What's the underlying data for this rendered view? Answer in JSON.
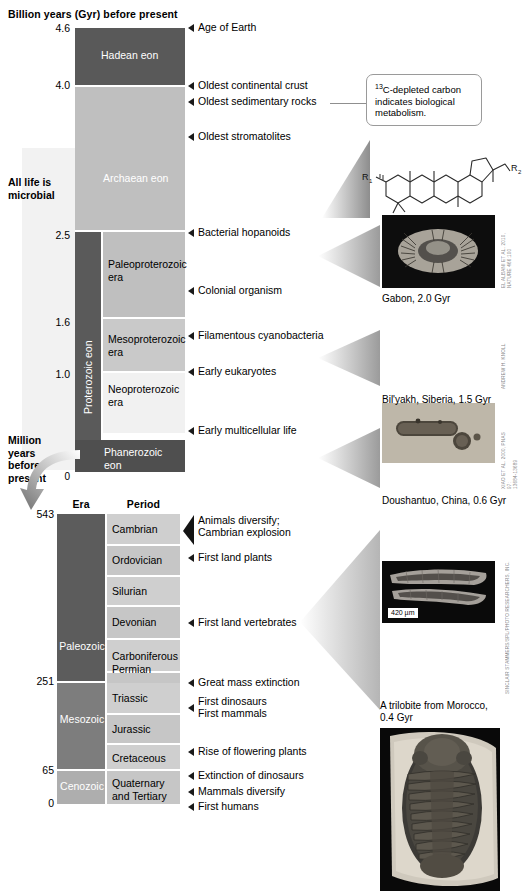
{
  "headers": {
    "top_axis_title": "Billion years (Gyr) before present",
    "lower_axis_title_line1": "Million",
    "lower_axis_title_line2": "years",
    "lower_axis_title_line3": "before",
    "lower_axis_title_line4": "present",
    "era_col": "Era",
    "period_col": "Period"
  },
  "side_note": {
    "line1": "All life is",
    "line2": "microbial"
  },
  "axis_gyr": [
    "4.6",
    "4.0",
    "2.5",
    "1.6",
    "1.0",
    "0"
  ],
  "axis_myr": [
    "543",
    "251",
    "65",
    "0"
  ],
  "eons": {
    "hadean": "Hadean eon",
    "archaean": "Archaean eon",
    "proterozoic": "Proterozoic eon",
    "phanerozoic_l1": "Phanerozoic",
    "phanerozoic_l2": "eon"
  },
  "proterozoic_eras": [
    {
      "l1": "Paleoproterozoic",
      "l2": "era"
    },
    {
      "l1": "Mesoproterozoic",
      "l2": "era"
    },
    {
      "l1": "Neoproterozoic",
      "l2": "era"
    }
  ],
  "phanerozoic_eras": [
    "Paleozoic",
    "Mesozoic",
    "Cenozoic"
  ],
  "periods": [
    "Cambrian",
    "Ordovician",
    "Silurian",
    "Devonian",
    "Carboniferous",
    "Permian",
    "Triassic",
    "Jurassic",
    "Cretaceous",
    "Quaternary and Tertiary"
  ],
  "period_cenozoic_l1": "Quaternary",
  "period_cenozoic_l2": "and Tertiary",
  "events_upper": [
    "Age of Earth",
    "Oldest continental crust",
    "Oldest sedimentary rocks",
    "Oldest stromatolites",
    "Bacterial hopanoids",
    "Colonial organism",
    "Filamentous cyanobacteria",
    "Early eukaryotes",
    "Early multicellular life"
  ],
  "events_lower": [
    "Animals diversify;",
    "Cambrian explosion",
    "First land plants",
    "First land vertebrates",
    "Great mass extinction",
    "First dinosaurs",
    "First mammals",
    "Rise of flowering plants",
    "Extinction of dinosaurs",
    "Mammals diversify",
    "First humans"
  ],
  "callout": {
    "sup": "13",
    "text_rest": "C-depleted carbon indicates biological metabolism."
  },
  "molecule": {
    "r1": "R",
    "r1_sub": "1",
    "r2": "R",
    "r2_sub": "2"
  },
  "photos": [
    {
      "caption": "Gabon, 2.0 Gyr",
      "credit": "EL ALBANI ET AL. 2010,\nNATURE 466:100",
      "scalebar": ""
    },
    {
      "caption": "Bil'yakh, Siberia, 1.5 Gyr",
      "credit": "ANDREW H. KNOLL",
      "scalebar": ""
    },
    {
      "caption": "Doushantuo, China, 0.6 Gyr",
      "credit": "XIAO ET AL. 2000, PNAS 97:\n13684-13689",
      "scalebar": "420 µm"
    },
    {
      "caption_l1": "A trilobite from Morocco,",
      "caption_l2": "0.4 Gyr",
      "credit": "SINCLAIR STAMMERS/SPL/PHOTO RESEARCHERS, INC."
    }
  ],
  "colors": {
    "hadean": "#595959",
    "archaean": "#bfbfbf",
    "proterozoic_eon": "#5a5a5a",
    "paleoproterozoic": "#bfbfbf",
    "mesoproterozoic": "#c9c9c9",
    "neoproterozoic": "#f1f1f1",
    "phanerozoic": "#4f4f4f",
    "microbial_band": "#f2f2f2",
    "era_paleozoic": "#5c5c5c",
    "era_mesozoic": "#7d7d7d",
    "era_cenozoic": "#aeaeae",
    "period_fill": "#cfcfcf"
  }
}
